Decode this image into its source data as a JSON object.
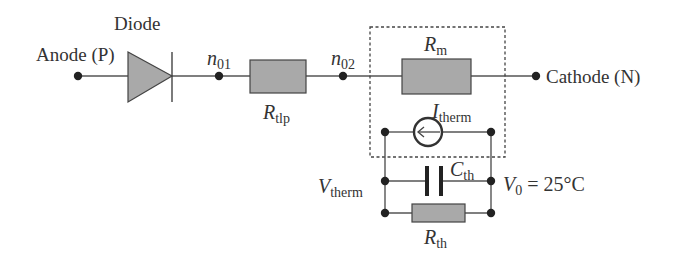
{
  "colors": {
    "wire": "#555555",
    "node": "#222222",
    "resistor_fill": "#a9a9a9",
    "diode_fill": "#a9a9a9",
    "text": "#333333"
  },
  "labels": {
    "diode": "Diode",
    "anode": "Anode (P)",
    "cathode": "Cathode (N)",
    "n01": {
      "main": "n",
      "sub": "01"
    },
    "n02": {
      "main": "n",
      "sub": "02"
    },
    "r_tlp": {
      "main": "R",
      "sub": "tlp"
    },
    "r_m": {
      "main": "R",
      "sub": "m"
    },
    "i_therm": {
      "main": "I",
      "sub": "therm"
    },
    "c_th": {
      "main": "C",
      "sub": "th"
    },
    "r_th": {
      "main": "R",
      "sub": "th"
    },
    "v_therm": {
      "main": "V",
      "sub": "therm"
    },
    "v0": {
      "main": "V",
      "sub": "0",
      "rest": " = 25°C"
    }
  },
  "components": [
    {
      "id": "diode",
      "type": "diode",
      "between": [
        "Anode (P)",
        "n01"
      ]
    },
    {
      "id": "R_tlp",
      "type": "resistor",
      "between": [
        "n01",
        "n02"
      ]
    },
    {
      "id": "R_m",
      "type": "resistor",
      "between": [
        "n02",
        "Cathode (N)"
      ]
    },
    {
      "id": "I_therm",
      "type": "current-source",
      "between": [
        "V_therm",
        "V0"
      ]
    },
    {
      "id": "C_th",
      "type": "capacitor",
      "between": [
        "V_therm",
        "V0"
      ]
    },
    {
      "id": "R_th",
      "type": "resistor",
      "between": [
        "V_therm",
        "V0"
      ]
    }
  ]
}
